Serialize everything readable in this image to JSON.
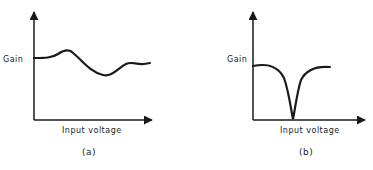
{
  "panels": [
    {
      "id": "a",
      "caption": "(a)",
      "ylabel": "Gain",
      "xlabel": "Input voltage",
      "curve": "wavy gain that slightly rises, dips, and levels off"
    },
    {
      "id": "b",
      "caption": "(b)",
      "ylabel": "Gain",
      "xlabel": "Input voltage",
      "curve": "flat gain with a sharp notch dropping to zero"
    }
  ],
  "colors": {
    "ink": "#1a1a1a",
    "background": "#ffffff"
  }
}
